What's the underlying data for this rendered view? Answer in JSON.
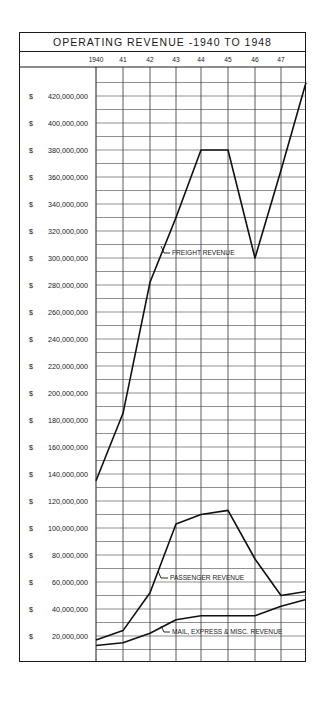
{
  "chart_data": {
    "type": "line",
    "title": "OPERATING REVENUE -1940 TO 1948",
    "xlabel": "",
    "ylabel": "",
    "x": [
      "1940",
      "41",
      "42",
      "43",
      "44",
      "45",
      "46",
      "47",
      "48"
    ],
    "x_tick_labels": [
      "1940",
      "41",
      "42",
      "43",
      "44",
      "45",
      "46",
      "47"
    ],
    "y_tick_labels": [
      "$ 420,000,000",
      "$ 400,000,000",
      "$ 380,000,000",
      "$ 360,000,000",
      "$ 340,000,000",
      "$ 320,000,000",
      "$ 300,000,000",
      "$ 280,000,000",
      "$ 260,000,000",
      "$ 240,000,000",
      "$ 220,000,000",
      "$ 200,000,000",
      "$ 180,000,000",
      "$ 160,000,000",
      "$ 140,000,000",
      "$ 120,000,000",
      "$ 100,000,000",
      "$ 80,000,000",
      "$ 60,000,000",
      "$ 40,000,000",
      "$ 20,000,000"
    ],
    "y_tick_values": [
      420,
      400,
      380,
      360,
      340,
      320,
      300,
      280,
      260,
      240,
      220,
      200,
      180,
      160,
      140,
      120,
      100,
      80,
      60,
      40,
      20
    ],
    "ylim": [
      0,
      430
    ],
    "units": "millions of dollars",
    "grid": true,
    "grid_step": 10,
    "series": [
      {
        "name": "FREIGHT REVENUE",
        "values": [
          135,
          185,
          282,
          330,
          380,
          380,
          300,
          365,
          430
        ]
      },
      {
        "name": "PASSENGER REVENUE",
        "values": [
          17,
          24,
          52,
          103,
          110,
          113,
          77,
          50,
          53
        ]
      },
      {
        "name": "MAIL, EXPRESS & MISC. REVENUE",
        "values": [
          13,
          15,
          22,
          32,
          35,
          35,
          35,
          42,
          47
        ]
      }
    ],
    "annotations": [
      "FREIGHT REVENUE",
      "PASSENGER REVENUE",
      "MAIL, EXPRESS & MISC. REVENUE"
    ]
  }
}
